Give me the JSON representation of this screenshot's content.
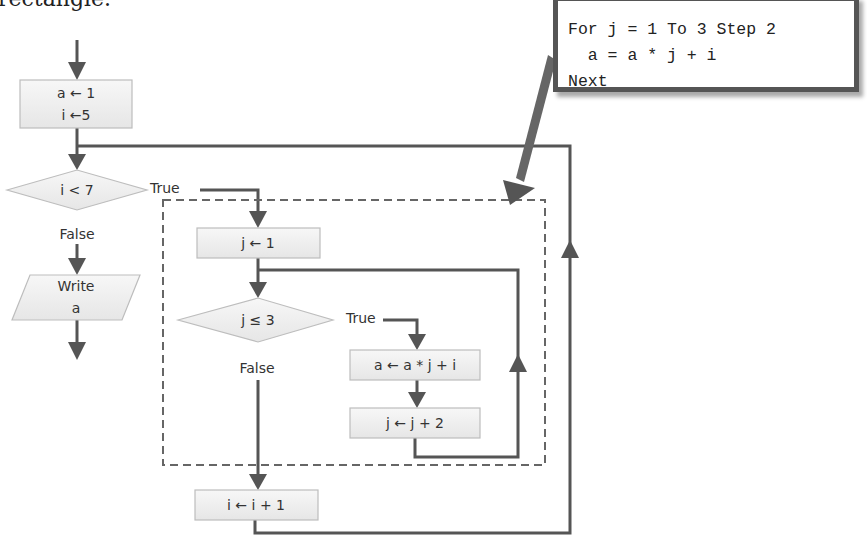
{
  "caption": {
    "text": "rectangle."
  },
  "callout": {
    "code_lines": [
      "For j = 1 To 3 Step 2",
      "  a = a * j + i",
      "Next"
    ]
  },
  "flowchart": {
    "init_box": {
      "line1": "a ← 1",
      "line2": "i ←5"
    },
    "outer_decision": {
      "label": "i < 7",
      "true_label": "True",
      "false_label": "False"
    },
    "output": {
      "line1": "Write",
      "line2": "a"
    },
    "inner_init": {
      "label": "j ← 1"
    },
    "inner_decision": {
      "label": "j ≤ 3",
      "true_label": "True",
      "false_label": "False"
    },
    "body": {
      "label": "a ← a * j + i"
    },
    "increment_j": {
      "label": "j ← j + 2"
    },
    "increment_i": {
      "label": "i ← i + 1"
    }
  },
  "colors": {
    "line": "#555555",
    "box_fill": "#efefef",
    "box_border": "#bdbdbd",
    "dashed": "#666666"
  }
}
